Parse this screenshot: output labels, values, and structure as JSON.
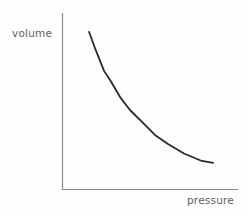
{
  "chart_data": {
    "type": "line",
    "title": "",
    "subtitle": "",
    "xlabel": "pressure",
    "ylabel": "volume",
    "grid": false,
    "legend": null,
    "legend_position": "none",
    "annotations": [],
    "xtick_labels": [],
    "ytick_labels": [],
    "xlim": [
      0,
      1
    ],
    "ylim": [
      0,
      1
    ],
    "axis_style": "two-sided open (left spine and bottom spine only, no ticks)",
    "relationship": "inverse proportionality: volume decreases as pressure increases (hyperbolic decay)",
    "series": [
      {
        "name": "volume vs pressure",
        "color": "#2a2a2a",
        "line_width": 1.8,
        "points": [
          {
            "x": 0.154,
            "y": 0.893
          },
          {
            "x": 0.193,
            "y": 0.787
          },
          {
            "x": 0.239,
            "y": 0.673
          },
          {
            "x": 0.273,
            "y": 0.621
          },
          {
            "x": 0.33,
            "y": 0.525
          },
          {
            "x": 0.386,
            "y": 0.452
          },
          {
            "x": 0.449,
            "y": 0.39
          },
          {
            "x": 0.528,
            "y": 0.311
          },
          {
            "x": 0.602,
            "y": 0.26
          },
          {
            "x": 0.693,
            "y": 0.206
          },
          {
            "x": 0.795,
            "y": 0.164
          },
          {
            "x": 0.858,
            "y": 0.153
          }
        ]
      }
    ]
  },
  "labels": {
    "y_axis": "volume",
    "x_axis": "pressure"
  },
  "colors": {
    "background": "#fdfdfd",
    "axis": "#8a8a8a",
    "curve": "#2a2a2a",
    "label_text": "#5f5f5f"
  },
  "geometry": {
    "axis_origin_x": 62,
    "axis_origin_y": 190,
    "axis_top_y": 13,
    "axis_right_x": 238,
    "curve_start": [
      89,
      32
    ],
    "curve_end": [
      213,
      163
    ]
  }
}
